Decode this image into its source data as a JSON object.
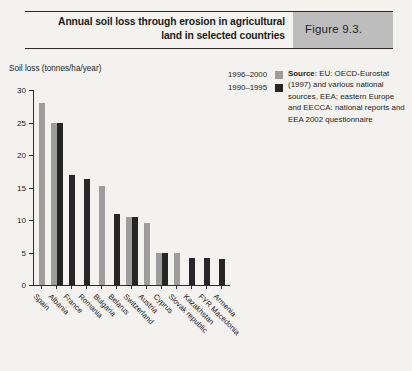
{
  "header": {
    "title": "Annual soil loss through erosion in agricultural land in selected countries",
    "figure_label": "Figure 9.3."
  },
  "legend": {
    "items": [
      {
        "label": "1996–2000",
        "swatch": "light-gray",
        "color": "#9d9d9d"
      },
      {
        "label": "1990–1995",
        "swatch": "black",
        "color": "#262626"
      }
    ]
  },
  "source": {
    "prefix": "Source",
    "text": ": EU: OECD-Eurostat (1997) and various national sources, EEA; eastern Europe and EECCA: national reports and EEA 2002 questionnaire"
  },
  "chart_data": {
    "type": "bar",
    "title": "Annual soil loss through erosion in agricultural land in selected countries",
    "xlabel": "",
    "ylabel": "Soil loss (tonnes/ha/year)",
    "ylim": [
      0,
      30
    ],
    "yticks": [
      0,
      5,
      10,
      15,
      20,
      25,
      30
    ],
    "ytick_labels": [
      "0",
      "5",
      "10",
      "15",
      "20",
      "25",
      "30"
    ],
    "grid": false,
    "legend_position": "top-right",
    "categories": [
      "Spain",
      "Albania",
      "France",
      "Romania",
      "Bulgaria",
      "Belarus",
      "Switzerland",
      "Austria",
      "Cyprus",
      "Slovak republic",
      "Kazakhstan",
      "FYR Macedonia",
      "Armenia"
    ],
    "series": [
      {
        "name": "1996–2000",
        "color": "#9d9d9d",
        "values": [
          28.0,
          25.0,
          null,
          null,
          15.2,
          null,
          10.5,
          9.5,
          5.0,
          4.9,
          null,
          null,
          null
        ]
      },
      {
        "name": "1990–1995",
        "color": "#262626",
        "values": [
          null,
          25.0,
          17.0,
          16.3,
          null,
          11.0,
          10.4,
          null,
          4.9,
          null,
          4.2,
          4.1,
          4.0
        ]
      }
    ]
  }
}
